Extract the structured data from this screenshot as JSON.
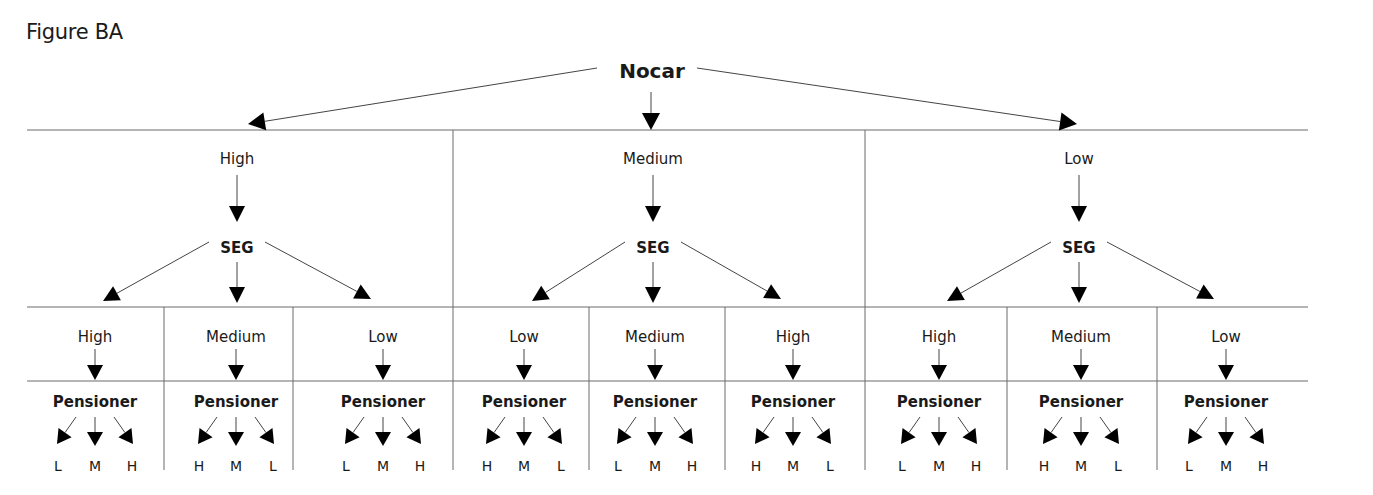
{
  "figure": {
    "title": "Figure BA",
    "root_label": "Nocar",
    "level1_node_label": "SEG",
    "level2_node_label": "Pensioner",
    "branches": [
      {
        "label": "High",
        "children": [
          {
            "label": "High",
            "leaves": [
              "L",
              "M",
              "H"
            ]
          },
          {
            "label": "Medium",
            "leaves": [
              "H",
              "M",
              "L"
            ]
          },
          {
            "label": "Low",
            "leaves": [
              "L",
              "M",
              "H"
            ]
          }
        ]
      },
      {
        "label": "Medium",
        "children": [
          {
            "label": "Low",
            "leaves": [
              "H",
              "M",
              "L"
            ]
          },
          {
            "label": "Medium",
            "leaves": [
              "L",
              "M",
              "H"
            ]
          },
          {
            "label": "High",
            "leaves": [
              "H",
              "M",
              "L"
            ]
          }
        ]
      },
      {
        "label": "Low",
        "children": [
          {
            "label": "High",
            "leaves": [
              "L",
              "M",
              "H"
            ]
          },
          {
            "label": "Medium",
            "leaves": [
              "H",
              "M",
              "L"
            ]
          },
          {
            "label": "Low",
            "leaves": [
              "L",
              "M",
              "H"
            ]
          }
        ]
      }
    ]
  },
  "colors": {
    "line": "#6b6b6b",
    "arrow": "#000000",
    "text": "#1a1a1a"
  }
}
